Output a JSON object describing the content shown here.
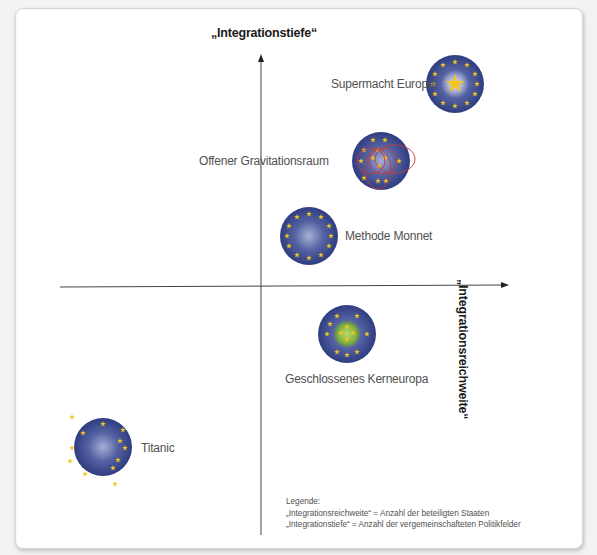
{
  "diagram": {
    "y_axis_title": "„Integrationstiefe“",
    "x_axis_title": "„Integrationsreichweite“",
    "colors": {
      "globe_dark": "#2a3a7a",
      "globe_light": "#8a95c4",
      "star": "#f0c41e",
      "core_green": "#7fb33a",
      "overlay_red": "#c8393c",
      "axis": "#333333",
      "label_text": "#505050"
    },
    "nodes": [
      {
        "id": "supermacht-europa",
        "label": "Supermacht Europa",
        "variant": "single-large-star"
      },
      {
        "id": "offener-gravitationsraum",
        "label": "Offener Gravitationsraum",
        "variant": "overlapping-red-circles"
      },
      {
        "id": "methode-monnet",
        "label": "Methode Monnet",
        "variant": "standard-ring"
      },
      {
        "id": "geschlossenes-kerneuropa",
        "label": "Geschlossenes Kerneuropa",
        "variant": "green-core"
      },
      {
        "id": "titanic",
        "label": "Titanic",
        "variant": "scattered-stars"
      }
    ],
    "legend": {
      "title": "Legende:",
      "lines": [
        "„Integrationsreichweite“ = Anzahl der beteiligten Staaten",
        "„Integrationstiefe“ = Anzahl der vergemeinschafteten Politikfelder"
      ]
    }
  }
}
